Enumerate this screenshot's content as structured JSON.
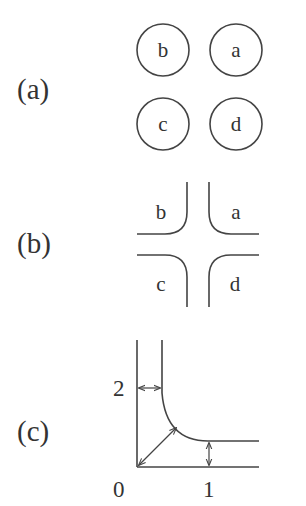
{
  "panels": {
    "a": {
      "label": "(a)",
      "nodes": [
        {
          "id": "b",
          "label": "b",
          "cx": 163,
          "cy": 50
        },
        {
          "id": "a",
          "label": "a",
          "cx": 236,
          "cy": 50
        },
        {
          "id": "c",
          "label": "c",
          "cx": 163,
          "cy": 124
        },
        {
          "id": "d",
          "label": "d",
          "cx": 236,
          "cy": 124
        }
      ]
    },
    "b": {
      "label": "(b)",
      "regions": [
        {
          "id": "b",
          "label": "b"
        },
        {
          "id": "a",
          "label": "a"
        },
        {
          "id": "c",
          "label": "c"
        },
        {
          "id": "d",
          "label": "d"
        }
      ]
    },
    "c": {
      "label": "(c)",
      "axis_labels": {
        "origin": "0",
        "x_tick": "1",
        "y_tick": "2"
      }
    }
  },
  "colors": {
    "stroke": "#444444",
    "text": "#333333",
    "background": "#ffffff"
  }
}
